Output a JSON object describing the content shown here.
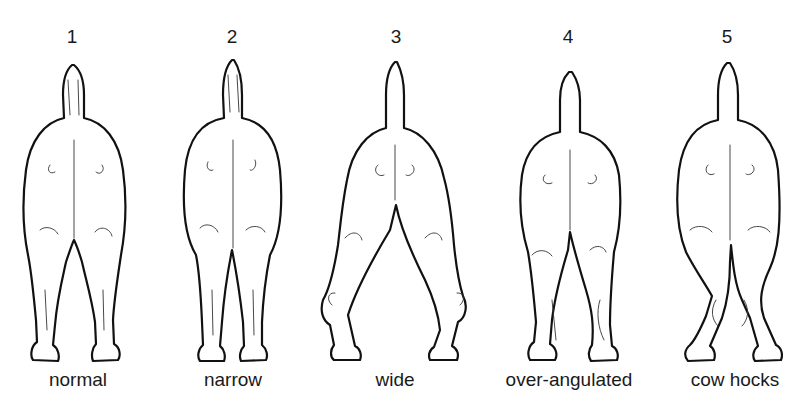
{
  "figure": {
    "panels": [
      {
        "number": "1",
        "label": "normal"
      },
      {
        "number": "2",
        "label": "narrow"
      },
      {
        "number": "3",
        "label": "wide"
      },
      {
        "number": "4",
        "label": "over-angulated"
      },
      {
        "number": "5",
        "label": "cow hocks"
      }
    ]
  }
}
